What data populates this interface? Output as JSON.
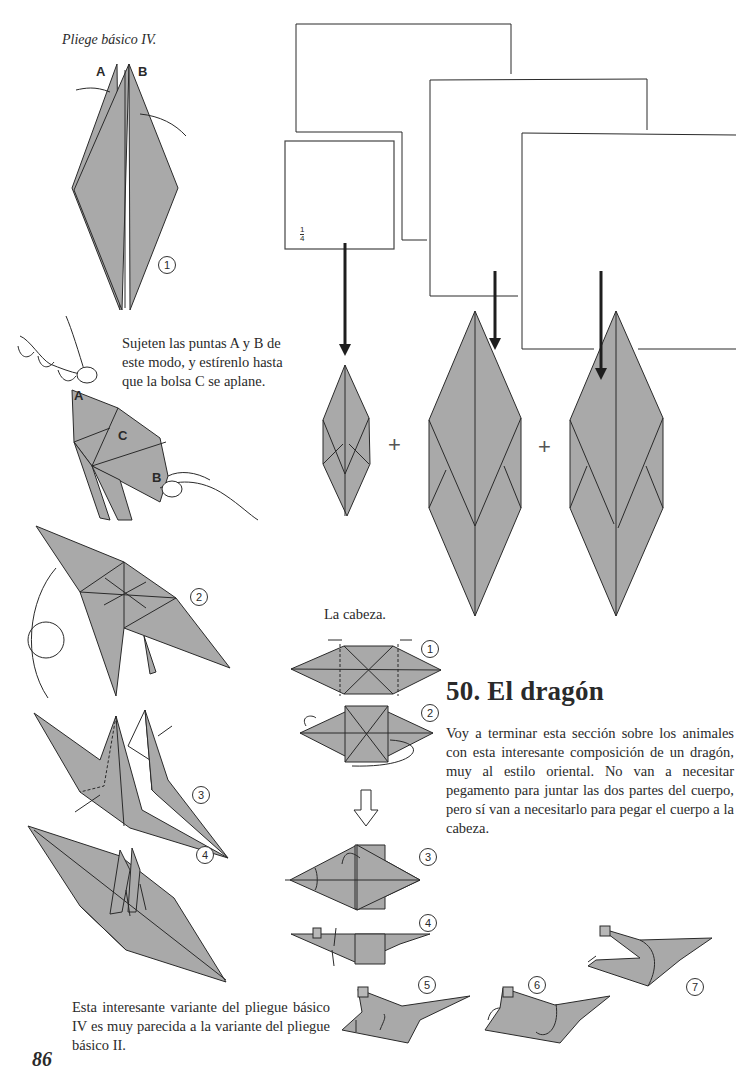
{
  "page": {
    "page_number": "86",
    "colors": {
      "paper_fill": "#a9a9a9",
      "stroke": "#2a2a2a",
      "background": "#ffffff"
    }
  },
  "left_column": {
    "title_caption": "Pliege básico IV.",
    "step1": {
      "number": "1",
      "label_a": "A",
      "label_b": "B"
    },
    "instruction": "Sujeten las puntas A y B de este modo, y estírenlo hasta que la bolsa C se aplane.",
    "hands_labels": {
      "a": "A",
      "b": "B",
      "c": "C"
    },
    "step2": {
      "number": "2"
    },
    "step3": {
      "number": "3"
    },
    "step4": {
      "number": "4"
    },
    "footer_note": "Esta interesante variante del pliegue básico IV es muy parecida a la variante del pliegue básico II."
  },
  "squares": {
    "fraction_label": "1/4",
    "fraction_num": "1",
    "fraction_den": "4",
    "plus_signs": [
      "+",
      "+"
    ]
  },
  "head_section": {
    "caption": "La cabeza.",
    "steps": [
      "1",
      "2",
      "3",
      "4",
      "5",
      "6",
      "7"
    ]
  },
  "article": {
    "heading": "50.  El dragón",
    "paragraph": "Voy a terminar esta sección sobre los animales con esta interesante composición de un dragón, muy al estilo oriental. No van a necesitar pegamento para juntar las dos partes del cuerpo, pero sí van a necesitarlo para pegar el cuerpo a la cabeza."
  }
}
